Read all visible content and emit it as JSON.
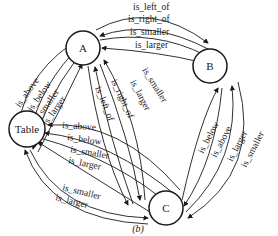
{
  "diagram": {
    "caption": "(b)",
    "nodes": [
      {
        "id": "A",
        "label": "A"
      },
      {
        "id": "B",
        "label": "B"
      },
      {
        "id": "Table",
        "label": "Table"
      },
      {
        "id": "C",
        "label": "C"
      }
    ],
    "edges": {
      "a_b": [
        "is_left_of",
        "is_right_of",
        "is_smaller",
        "is_larger"
      ],
      "a_table": [
        "is_above",
        "is_below",
        "is_smaller",
        "is_larger"
      ],
      "a_c": [
        "is_left_of",
        "is_right_of",
        "is_larger",
        "is_smaller"
      ],
      "c_table": [
        "is_above",
        "is_below",
        "is_smaller",
        "is_larger",
        "is_smaller",
        "is_larger"
      ],
      "c_b": [
        "is_below",
        "is_above",
        "is_larger",
        "is_smaller"
      ]
    }
  }
}
